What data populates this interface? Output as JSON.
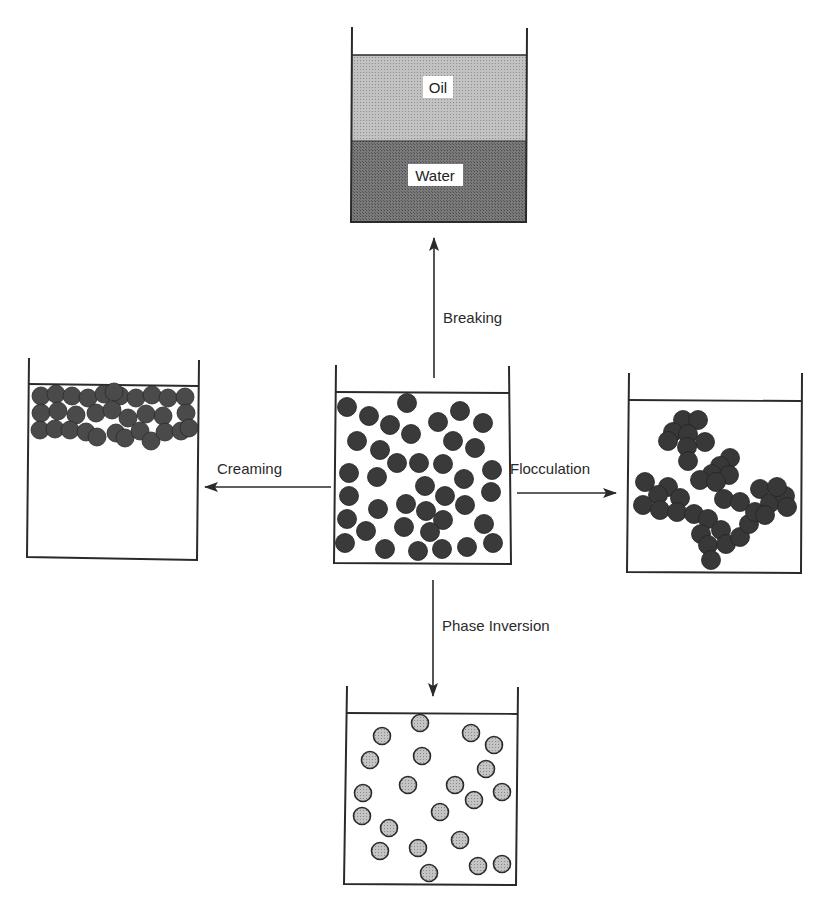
{
  "diagram": {
    "title": "",
    "colors": {
      "line": "#2a2a2a",
      "oil": "#b5b5b5",
      "water": "#6e6e6e",
      "droplet_dark": "#3a3a3a",
      "droplet_light": "#b8b8b8"
    },
    "center_beaker": {
      "name": "initial-emulsion",
      "droplet_style": "dark",
      "droplet_count": 44
    },
    "processes": [
      {
        "id": "breaking",
        "label": "Breaking",
        "direction": "up",
        "result": "separated-layers"
      },
      {
        "id": "creaming",
        "label": "Creaming",
        "direction": "left",
        "result": "droplets-at-top"
      },
      {
        "id": "flocculation",
        "label": "Flocculation",
        "direction": "right",
        "result": "clustered-droplets"
      },
      {
        "id": "phase_inversion",
        "label": "Phase Inversion",
        "direction": "down",
        "result": "light-droplets"
      }
    ],
    "breaking_beaker": {
      "layers": [
        {
          "label": "Oil"
        },
        {
          "label": "Water"
        }
      ]
    }
  }
}
